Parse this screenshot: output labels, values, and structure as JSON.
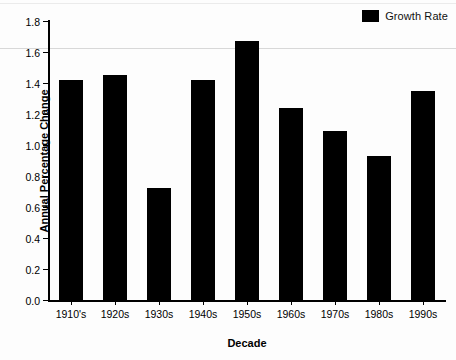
{
  "chart_data": {
    "type": "bar",
    "title": "",
    "subtitle": "",
    "xlabel": "Decade",
    "ylabel": "Annual Percentage Change",
    "categories": [
      "1910's",
      "1920s",
      "1930s",
      "1940s",
      "1950s",
      "1960s",
      "1970s",
      "1980s",
      "1990s"
    ],
    "values": [
      1.42,
      1.45,
      0.72,
      1.42,
      1.67,
      1.24,
      1.09,
      0.93,
      1.35
    ],
    "series": [
      {
        "name": "Growth Rate",
        "values": [
          1.42,
          1.45,
          0.72,
          1.42,
          1.67,
          1.24,
          1.09,
          0.93,
          1.35
        ],
        "color": "#000000"
      }
    ],
    "ylim": [
      0.0,
      1.8
    ],
    "ytick_labels": [
      "0.0",
      "0.2",
      "0.4",
      "0.6",
      "0.8",
      "1.0",
      "1.2",
      "1.4",
      "1.6",
      "1.8"
    ],
    "ytick_values": [
      0.0,
      0.2,
      0.4,
      0.6,
      0.8,
      1.0,
      1.2,
      1.4,
      1.6,
      1.8
    ],
    "grid": false,
    "legend_position": "top-right",
    "legend_entries": [
      {
        "label": "Growth Rate",
        "color": "#000000"
      }
    ],
    "annotations": []
  },
  "legend": {
    "label": "Growth Rate"
  },
  "axes": {
    "x_title": "Decade",
    "y_title": "Annual Percentage Change"
  },
  "colors": {
    "bar": "#000000",
    "axis": "#000000",
    "background": "#fdfdfd",
    "artifact_line": "#d8d8d8"
  }
}
